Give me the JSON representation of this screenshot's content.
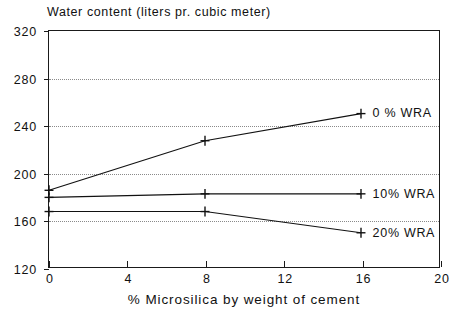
{
  "chart_data": {
    "type": "line",
    "title": "Water content (liters pr. cubic meter)",
    "xlabel": "% Microsilica by weight of cement",
    "ylabel": "Water content (liters pr. cubic meter)",
    "xlim": [
      0,
      20
    ],
    "ylim": [
      120,
      320
    ],
    "xticks": [
      0,
      4,
      8,
      12,
      16,
      20
    ],
    "yticks": [
      120,
      160,
      200,
      240,
      280,
      320
    ],
    "xtick_labels": [
      "0",
      "4",
      "8",
      "12",
      "16",
      "20"
    ],
    "ytick_labels": [
      "120",
      "160",
      "200",
      "240",
      "280",
      "320"
    ],
    "grid": "horizontal-dotted",
    "legend_position": "right-inline",
    "marker": "plus",
    "series": [
      {
        "name": "0 % WRA",
        "label": "0 % WRA",
        "x": [
          0,
          8,
          16
        ],
        "values": [
          185,
          227,
          250
        ]
      },
      {
        "name": "10% WRA",
        "label": "10% WRA",
        "x": [
          0,
          8,
          16
        ],
        "values": [
          179,
          182,
          182
        ]
      },
      {
        "name": "20% WRA",
        "label": "20% WRA",
        "x": [
          0,
          8,
          16
        ],
        "values": [
          167,
          167,
          149
        ]
      }
    ]
  }
}
